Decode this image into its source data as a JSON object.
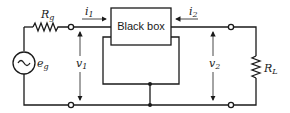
{
  "diagram": {
    "type": "two-port network circuit",
    "black_box": {
      "label": "Black box"
    },
    "source": {
      "resistor_label": "R",
      "resistor_sub": "g",
      "source_label": "e",
      "source_sub": "g",
      "source_symbol": "~"
    },
    "load": {
      "label": "R",
      "sub": "L"
    },
    "currents": [
      {
        "label": "i",
        "sub": "1",
        "direction": "right"
      },
      {
        "label": "i",
        "sub": "2",
        "direction": "left"
      }
    ],
    "voltages": [
      {
        "label": "v",
        "sub": "1"
      },
      {
        "label": "v",
        "sub": "2"
      }
    ],
    "colors": {
      "line": "#1a1a1a",
      "background": "#ffffff"
    }
  }
}
